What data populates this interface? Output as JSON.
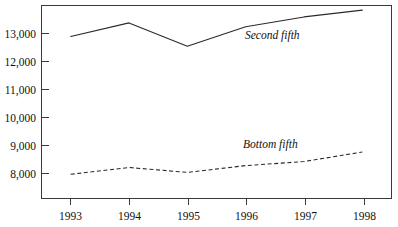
{
  "chart_data": {
    "type": "line",
    "title": "",
    "subtitle": "",
    "xlabel": "",
    "ylabel": "",
    "categories": [
      "1993",
      "1994",
      "1995",
      "1996",
      "1997",
      "1998"
    ],
    "x": [
      1993,
      1994,
      1995,
      1996,
      1997,
      1998
    ],
    "xlim": [
      1992.5,
      1998.5
    ],
    "ylim": [
      7000,
      14100
    ],
    "grid": false,
    "legend_position": "inline-annotation",
    "yticks": [
      8000,
      9000,
      10000,
      11000,
      12000,
      13000
    ],
    "ytick_labels": [
      "8,000",
      "9,000",
      "10,000",
      "11,000",
      "12,000",
      "13,000"
    ],
    "xtick_labels": [
      "1993",
      "1994",
      "1995",
      "1996",
      "1997",
      "1998"
    ],
    "series": [
      {
        "name": "Second fifth",
        "style": "solid",
        "annotation": "Second fifth",
        "values": [
          12960,
          13460,
          12600,
          13320,
          13680,
          13930
        ]
      },
      {
        "name": "Bottom fifth",
        "style": "dashed",
        "annotation": "Bottom fifth",
        "values": [
          7890,
          8140,
          7960,
          8210,
          8360,
          8710
        ]
      }
    ],
    "annotations": [
      {
        "text": "Second fifth",
        "x": 1996.0,
        "y": 13180
      },
      {
        "text": "Bottom fifth",
        "x": 1995.95,
        "y": 9050
      }
    ],
    "colors": {
      "line": "#2a2a2a",
      "axis": "#3a3a3a",
      "background": "#ffffff",
      "text": "#111111"
    }
  }
}
